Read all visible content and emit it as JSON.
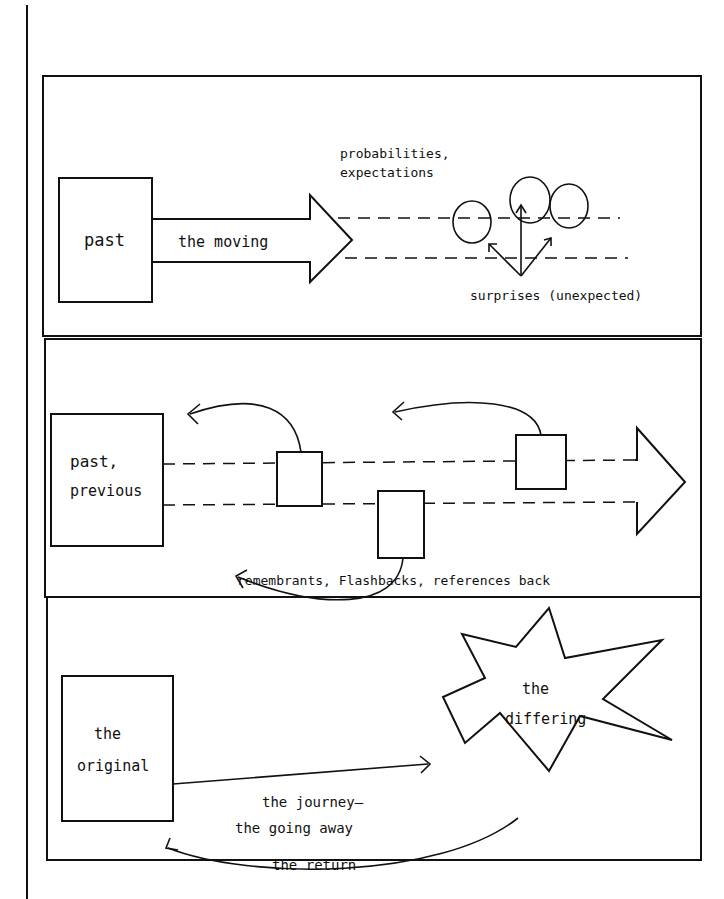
{
  "page": {
    "margin_line": true
  },
  "panels": [
    {
      "id": "expectation",
      "labels": {
        "box": "past",
        "arrow": "the moving",
        "lines": [
          "probabilities,",
          "expectations"
        ],
        "surprises": "surprises (unexpected)"
      }
    },
    {
      "id": "flashback",
      "labels": {
        "box_line1": "past,",
        "box_line2": "previous",
        "caption": "remembrants, Flashbacks, references back"
      }
    },
    {
      "id": "journey",
      "labels": {
        "box_line1": "the",
        "box_line2": "original",
        "star_line1": "the",
        "star_line2": "differing",
        "journey_line1": "the journey–",
        "journey_line2": "the going away",
        "return": "the return"
      }
    }
  ],
  "colors": {
    "ink": "#111111",
    "paper": "#ffffff"
  }
}
